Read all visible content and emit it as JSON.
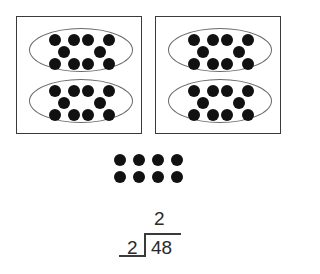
{
  "diagram": {
    "colors": {
      "dot": "#111111",
      "box_border": "#3a3a3a",
      "oval_border": "#6a6a6a",
      "text": "#2a2a2a"
    },
    "groups": [
      {
        "label": "box-1",
        "ovals": [
          {
            "dots": 10
          },
          {
            "dots": 10
          }
        ]
      },
      {
        "label": "box-2",
        "ovals": [
          {
            "dots": 10
          },
          {
            "dots": 10
          }
        ]
      }
    ],
    "loose_dots": {
      "rows": 2,
      "cols": 4,
      "count": 8
    }
  },
  "division": {
    "quotient": "2",
    "divisor": "2",
    "dividend": "48"
  }
}
